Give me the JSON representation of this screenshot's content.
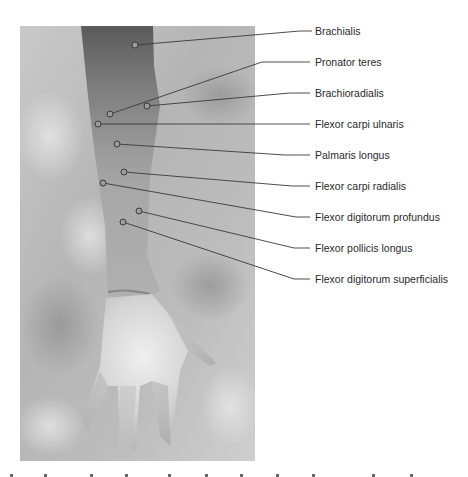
{
  "figure": {
    "photo_description": "Grayscale photograph of an anterior forearm and open palm on a mottled background",
    "colors": {
      "background": "#ffffff",
      "label_text": "#2a2a2a",
      "leader_line": "#3a3a3a",
      "marker_stroke": "#3a3a3a"
    },
    "labels": [
      {
        "text": "Brachialis",
        "marker": [
          135,
          45
        ],
        "bend": [
          300,
          31
        ],
        "y": 31
      },
      {
        "text": "Pronator teres",
        "marker": [
          110,
          114
        ],
        "bend": [
          262,
          62
        ],
        "y": 62
      },
      {
        "text": "Brachioradialis",
        "marker": [
          147,
          106
        ],
        "bend": [
          290,
          93
        ],
        "y": 93
      },
      {
        "text": "Flexor carpi ulnaris",
        "marker": [
          98,
          124
        ],
        "bend": [
          280,
          124
        ],
        "y": 124
      },
      {
        "text": "Palmaris longus",
        "marker": [
          117,
          144
        ],
        "bend": [
          285,
          155
        ],
        "y": 155
      },
      {
        "text": "Flexor carpi radialis",
        "marker": [
          124,
          172
        ],
        "bend": [
          292,
          186
        ],
        "y": 186
      },
      {
        "text": "Flexor digitorum profundus",
        "marker": [
          103,
          183
        ],
        "bend": [
          296,
          217
        ],
        "y": 217
      },
      {
        "text": "Flexor pollicis longus",
        "marker": [
          139,
          211
        ],
        "bend": [
          294,
          248
        ],
        "y": 248
      },
      {
        "text": "Flexor digitorum superficialis",
        "marker": [
          123,
          222
        ],
        "bend": [
          294,
          279
        ],
        "y": 279
      }
    ]
  }
}
